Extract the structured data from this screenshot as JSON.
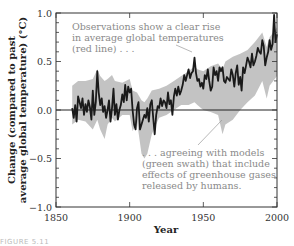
{
  "chart_data": {
    "type": "line",
    "title": "",
    "xlabel": "Year",
    "ylabel_line1": "Change (compared to past",
    "ylabel_line2": "average global temperature) (°C)",
    "xlim": [
      1850,
      2000
    ],
    "ylim": [
      -1.0,
      1.0
    ],
    "x_ticks": [
      "1850",
      "1900",
      "1950",
      "2000"
    ],
    "y_ticks": [
      "1.0",
      "0.5",
      "0.0",
      "−0.5",
      "−1.0"
    ],
    "grid": false,
    "zero_line": true,
    "annotations": [
      {
        "lines": [
          "Observations show a clear rise",
          "in average global temperatures",
          "(red line) . . ."
        ],
        "points_to": {
          "year": 1944,
          "value": 0.54
        }
      },
      {
        "lines": [
          ". . . agreeing with models",
          "(green swath) that include",
          "effects of greenhouse gases",
          "released by humans."
        ],
        "points_to": {
          "year": 1963,
          "value": -0.12
        }
      }
    ],
    "series": [
      {
        "name": "Observations (red line)",
        "color": "#1a1a1a",
        "x": [
          1861,
          1862,
          1863,
          1864,
          1865,
          1866,
          1867,
          1868,
          1869,
          1870,
          1871,
          1872,
          1873,
          1874,
          1875,
          1876,
          1877,
          1878,
          1879,
          1880,
          1881,
          1882,
          1883,
          1884,
          1885,
          1886,
          1887,
          1888,
          1889,
          1890,
          1891,
          1892,
          1893,
          1894,
          1895,
          1896,
          1897,
          1898,
          1899,
          1900,
          1901,
          1902,
          1903,
          1904,
          1905,
          1906,
          1907,
          1908,
          1909,
          1910,
          1911,
          1912,
          1913,
          1914,
          1915,
          1916,
          1917,
          1918,
          1919,
          1920,
          1921,
          1922,
          1923,
          1924,
          1925,
          1926,
          1927,
          1928,
          1929,
          1930,
          1931,
          1932,
          1933,
          1934,
          1935,
          1936,
          1937,
          1938,
          1939,
          1940,
          1941,
          1942,
          1943,
          1944,
          1945,
          1946,
          1947,
          1948,
          1949,
          1950,
          1951,
          1952,
          1953,
          1954,
          1955,
          1956,
          1957,
          1958,
          1959,
          1960,
          1961,
          1962,
          1963,
          1964,
          1965,
          1966,
          1967,
          1968,
          1969,
          1970,
          1971,
          1972,
          1973,
          1974,
          1975,
          1976,
          1977,
          1978,
          1979,
          1980,
          1981,
          1982,
          1983,
          1984,
          1985,
          1986,
          1987,
          1988,
          1989,
          1990,
          1991,
          1992,
          1993,
          1994,
          1995,
          1996,
          1997,
          1998,
          1999,
          2000
        ],
        "values": [
          0.02,
          -0.08,
          0.05,
          -0.12,
          0.14,
          0.08,
          0.02,
          0.12,
          -0.05,
          0.06,
          -0.02,
          0.1,
          0.03,
          -0.1,
          0.2,
          -0.05,
          0.08,
          0.4,
          0.18,
          0.05,
          0.12,
          -0.02,
          0.04,
          -0.08,
          0.0,
          0.1,
          -0.12,
          0.02,
          0.22,
          -0.05,
          0.06,
          -0.1,
          0.0,
          0.05,
          0.16,
          0.08,
          0.26,
          0.1,
          0.24,
          0.18,
          0.22,
          0.0,
          -0.15,
          -0.2,
          0.02,
          0.08,
          -0.2,
          -0.15,
          -0.1,
          -0.05,
          -0.08,
          0.02,
          -0.12,
          0.06,
          0.1,
          -0.08,
          -0.25,
          -0.05,
          0.04,
          0.02,
          0.12,
          0.04,
          0.1,
          0.08,
          0.02,
          0.18,
          0.06,
          0.1,
          -0.05,
          0.14,
          0.22,
          0.15,
          0.24,
          0.16,
          0.2,
          0.26,
          0.36,
          0.3,
          0.36,
          0.42,
          0.33,
          0.38,
          0.4,
          0.54,
          0.38,
          0.3,
          0.32,
          0.24,
          0.28,
          0.22,
          0.36,
          0.32,
          0.42,
          0.3,
          0.2,
          0.24,
          0.44,
          0.36,
          0.4,
          0.3,
          0.44,
          0.4,
          0.44,
          0.3,
          0.28,
          0.34,
          0.32,
          0.3,
          0.42,
          0.36,
          0.24,
          0.38,
          0.46,
          0.26,
          0.34,
          0.2,
          0.44,
          0.38,
          0.46,
          0.54,
          0.5,
          0.44,
          0.58,
          0.46,
          0.5,
          0.56,
          0.64,
          0.6,
          0.58,
          0.72,
          0.66,
          0.46,
          0.54,
          0.6,
          0.72,
          0.62,
          0.68,
          0.98,
          0.7,
          0.78
        ]
      },
      {
        "name": "Models (green swath)",
        "color": "#b8b8b8",
        "band": true,
        "x": [
          1861,
          1865,
          1870,
          1875,
          1878,
          1880,
          1883,
          1885,
          1888,
          1890,
          1895,
          1900,
          1902,
          1905,
          1908,
          1910,
          1912,
          1915,
          1920,
          1925,
          1930,
          1935,
          1940,
          1944,
          1946,
          1950,
          1955,
          1960,
          1963,
          1965,
          1970,
          1975,
          1980,
          1985,
          1990,
          1993,
          1995,
          2000
        ],
        "lower": [
          -0.15,
          -0.1,
          -0.12,
          -0.2,
          -0.1,
          -0.2,
          -0.3,
          -0.15,
          -0.08,
          -0.12,
          -0.05,
          -0.05,
          -0.22,
          -0.12,
          -0.45,
          -0.5,
          -0.45,
          -0.25,
          -0.08,
          -0.05,
          0.0,
          0.05,
          0.05,
          0.08,
          0.05,
          0.0,
          -0.02,
          -0.05,
          -0.25,
          -0.15,
          -0.1,
          0.0,
          0.08,
          0.15,
          0.3,
          0.12,
          0.25,
          0.35
        ],
        "upper": [
          0.25,
          0.3,
          0.3,
          0.32,
          0.42,
          0.35,
          0.3,
          0.32,
          0.36,
          0.3,
          0.28,
          0.32,
          0.2,
          0.18,
          0.1,
          0.08,
          0.12,
          0.2,
          0.22,
          0.25,
          0.3,
          0.35,
          0.4,
          0.45,
          0.42,
          0.4,
          0.45,
          0.48,
          0.42,
          0.5,
          0.55,
          0.58,
          0.62,
          0.7,
          0.8,
          0.65,
          0.75,
          0.85
        ]
      }
    ]
  },
  "caption": "FIGURE 5.11"
}
